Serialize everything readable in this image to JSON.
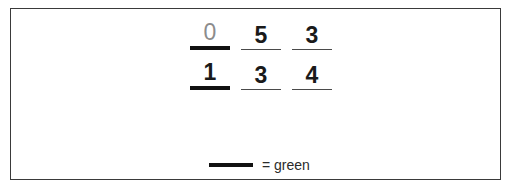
{
  "figure": {
    "type": "digit-grid-with-legend",
    "border_color": "#3a3a3a",
    "background_color": "#ffffff"
  },
  "rows": [
    {
      "row_index": 1,
      "cells": [
        {
          "digit": "0",
          "color": "#8c8c8c",
          "style": "muted",
          "underline": "thick",
          "underline_color": "#111111",
          "marked": true
        },
        {
          "digit": "5",
          "color": "#1a1a1a",
          "style": "normal",
          "underline": "thin",
          "underline_color": "#4a4a4a",
          "marked": false
        },
        {
          "digit": "3",
          "color": "#1a1a1a",
          "style": "normal",
          "underline": "thin",
          "underline_color": "#4a4a4a",
          "marked": false
        }
      ]
    },
    {
      "row_index": 2,
      "cells": [
        {
          "digit": "1",
          "color": "#1a1a1a",
          "style": "normal",
          "underline": "thick",
          "underline_color": "#111111",
          "marked": true
        },
        {
          "digit": "3",
          "color": "#1a1a1a",
          "style": "normal",
          "underline": "thin",
          "underline_color": "#4a4a4a",
          "marked": false
        },
        {
          "digit": "4",
          "color": "#1a1a1a",
          "style": "normal",
          "underline": "thin",
          "underline_color": "#4a4a4a",
          "marked": false
        }
      ]
    }
  ],
  "legend": {
    "swatch": "thick-line",
    "swatch_color": "#111111",
    "label": "= green"
  }
}
